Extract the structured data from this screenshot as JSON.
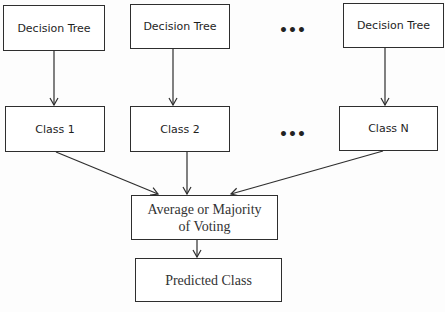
{
  "diagram": {
    "trees": [
      {
        "label": "Decision Tree"
      },
      {
        "label": "Decision Tree"
      },
      {
        "label": "Decision Tree"
      }
    ],
    "classes": [
      {
        "label": "Class 1"
      },
      {
        "label": "Class 2"
      },
      {
        "label": "Class N"
      }
    ],
    "ellipsis": "•••",
    "aggregator": {
      "label": "Average or Majority of Voting"
    },
    "output": {
      "label": "Predicted Class"
    },
    "colors": {
      "stroke": "#2e2e2e",
      "text": "#1e1e1e",
      "background": "#ffffff"
    }
  }
}
